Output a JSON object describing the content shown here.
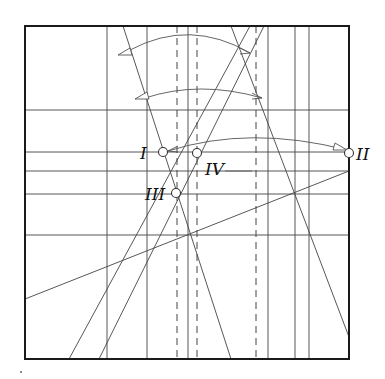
{
  "diagram": {
    "title": "",
    "frame": {
      "x1": 25,
      "y1": 26,
      "x2": 349,
      "y2": 359
    },
    "points": [
      {
        "id": "I",
        "label": "I",
        "x": 163,
        "y": 152,
        "label_x": 140,
        "label_y": 159
      },
      {
        "id": "II",
        "label": "II",
        "x": 349,
        "y": 153,
        "label_x": 356,
        "label_y": 160
      },
      {
        "id": "III",
        "label": "III",
        "x": 176,
        "y": 193,
        "label_x": 145,
        "label_y": 200
      },
      {
        "id": "IV",
        "label": "IV",
        "x": 197,
        "y": 153,
        "label_x": 205,
        "label_y": 175
      }
    ],
    "vertical_creases": [
      107,
      147,
      188,
      268,
      295,
      309
    ],
    "dashed_creases": [
      177,
      197,
      256
    ],
    "horizontal_creases": [
      110,
      152,
      171,
      194,
      235
    ],
    "diagonal_creases": [
      {
        "x1": 123,
        "y1": 26,
        "x2": 231,
        "y2": 359
      },
      {
        "x1": 231,
        "y1": 26,
        "x2": 349,
        "y2": 337
      },
      {
        "x1": 250,
        "y1": 26,
        "x2": 69,
        "y2": 359
      },
      {
        "x1": 264,
        "y1": 26,
        "x2": 99,
        "y2": 359
      },
      {
        "x1": 25,
        "y1": 299,
        "x2": 349,
        "y2": 171
      }
    ],
    "fold_arrows": [
      {
        "path": "M 130 50 Q 190 18 250 53",
        "head_x": 250,
        "head_y": 53,
        "tail_x": 118,
        "tail_y": 55
      },
      {
        "path": "M 145 98 Q 200 80 262 98",
        "head_x": 262,
        "head_y": 98,
        "tail_x": 135,
        "tail_y": 99
      },
      {
        "path": "M 168 151 Q 250 125 347 150",
        "head_x": 168,
        "head_y": 151,
        "tail_x": 347,
        "tail_y": 150
      }
    ],
    "colors": {
      "frame": "#1a1a1a",
      "crease": "#444444",
      "background": "#ffffff"
    }
  }
}
